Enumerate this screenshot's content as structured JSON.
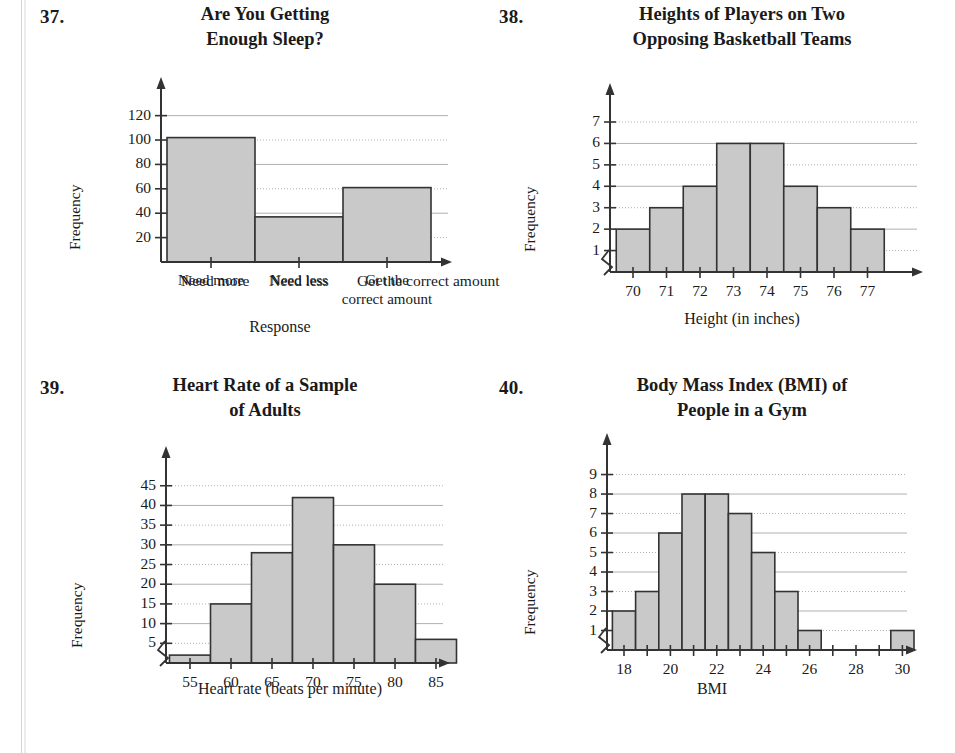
{
  "page": {
    "background_color": "#ffffff",
    "ink_color": "#1a1a1a",
    "bar_fill_color": "#c9c9c9",
    "bar_stroke_color": "#333333",
    "grid_color": "#b0b0b0",
    "axis_color": "#333333"
  },
  "exercises": [
    {
      "number": "37.",
      "title_lines": [
        "Are You Getting",
        "Enough Sleep?"
      ],
      "chart_data": {
        "type": "bar",
        "title": "Are You Getting Enough Sleep?",
        "xlabel": "Response",
        "ylabel": "Frequency",
        "categories": [
          "Need more",
          "Need less",
          "Get the correct amount"
        ],
        "category_label_lines": [
          [
            "Need more"
          ],
          [
            "Need less"
          ],
          [
            "Get the",
            "correct amount"
          ]
        ],
        "values": [
          102,
          37,
          61
        ],
        "ytick_labels": [
          "20",
          "40",
          "60",
          "80",
          "100",
          "120"
        ],
        "yticks": [
          20,
          40,
          60,
          80,
          100,
          120
        ],
        "ylim": [
          0,
          132
        ],
        "grid": true,
        "legend": "none",
        "axis_break": false
      }
    },
    {
      "number": "38.",
      "title_lines": [
        "Heights of Players on Two",
        "Opposing Basketball Teams"
      ],
      "chart_data": {
        "type": "bar",
        "title": "Heights of Players on Two Opposing Basketball Teams",
        "xlabel": "Height (in inches)",
        "ylabel": "Frequency",
        "categories": [
          "70",
          "71",
          "72",
          "73",
          "74",
          "75",
          "76",
          "77"
        ],
        "values": [
          2,
          3,
          4,
          6,
          6,
          4,
          3,
          2
        ],
        "ytick_labels": [
          "1",
          "2",
          "3",
          "4",
          "5",
          "6",
          "7"
        ],
        "yticks": [
          1,
          2,
          3,
          4,
          5,
          6,
          7
        ],
        "ylim": [
          0,
          7.7
        ],
        "grid": true,
        "legend": "none",
        "axis_break": true
      }
    },
    {
      "number": "39.",
      "title_lines": [
        "Heart Rate of a Sample",
        "of Adults"
      ],
      "chart_data": {
        "type": "bar",
        "title": "Heart Rate of a Sample of Adults",
        "xlabel": "Heart rate (beats per minute)",
        "ylabel": "Frequency",
        "categories": [
          "55",
          "60",
          "65",
          "70",
          "75",
          "80",
          "85"
        ],
        "values": [
          2,
          15,
          28,
          42,
          30,
          20,
          6
        ],
        "ytick_labels": [
          "5",
          "10",
          "15",
          "20",
          "25",
          "30",
          "35",
          "40",
          "45"
        ],
        "yticks": [
          5,
          10,
          15,
          20,
          25,
          30,
          35,
          40,
          45
        ],
        "ylim": [
          0,
          49
        ],
        "grid": true,
        "legend": "none",
        "axis_break": true
      }
    },
    {
      "number": "40.",
      "title_lines": [
        "Body Mass Index (BMI) of",
        "People in a Gym"
      ],
      "chart_data": {
        "type": "bar",
        "title": "Body Mass Index (BMI) of People in a Gym",
        "xlabel": "BMI",
        "ylabel": "Frequency",
        "categories": [
          "18",
          "19",
          "20",
          "21",
          "22",
          "23",
          "24",
          "25",
          "26",
          "27",
          "28",
          "29",
          "30"
        ],
        "xtick_labels_shown": [
          "18",
          "20",
          "22",
          "24",
          "26",
          "28",
          "30"
        ],
        "values": [
          2,
          3,
          6,
          8,
          8,
          7,
          5,
          3,
          1,
          0,
          0,
          0,
          1
        ],
        "ytick_labels": [
          "1",
          "2",
          "3",
          "4",
          "5",
          "6",
          "7",
          "8",
          "9"
        ],
        "yticks": [
          1,
          2,
          3,
          4,
          5,
          6,
          7,
          8,
          9
        ],
        "ylim": [
          0,
          9.9
        ],
        "grid": true,
        "legend": "none",
        "axis_break": true
      }
    }
  ]
}
